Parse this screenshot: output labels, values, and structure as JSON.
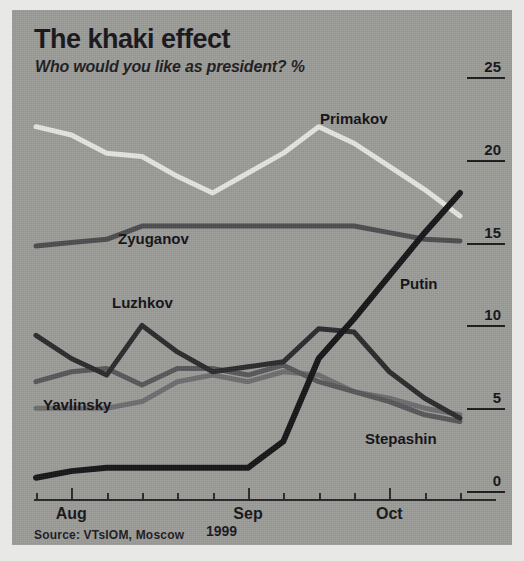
{
  "header": {
    "title": "The khaki effect",
    "subtitle": "Who would you like as president? %"
  },
  "source": "Source: VTsIOM, Moscow",
  "year_label": "1999",
  "colors": {
    "background": "#9c9c99",
    "text": "#141417",
    "primakov": "#e6e6e2",
    "zyuganov": "#4d4d50",
    "putin": "#161619",
    "luzhkov": "#2b2b2e",
    "yavlinsky": "#6e6e70",
    "stepashin": "#58585b"
  },
  "chart_data": {
    "type": "line",
    "title": "The khaki effect",
    "subtitle": "Who would you like as president? %",
    "xlabel": "1999",
    "ylabel": "%",
    "ylim": [
      0,
      25
    ],
    "yticks": [
      0,
      5,
      10,
      15,
      20,
      25
    ],
    "grid": false,
    "legend": "inline-labels",
    "x": [
      "Jul 25",
      "Aug 1",
      "Aug 8",
      "Aug 15",
      "Aug 22",
      "Aug 29",
      "Sep 5",
      "Sep 12",
      "Sep 19",
      "Sep 26",
      "Oct 3",
      "Oct 10",
      "Oct 17"
    ],
    "xtick_labels": [
      "Aug",
      "Sep",
      "Oct"
    ],
    "series": [
      {
        "name": "Primakov",
        "values": [
          22.0,
          21.5,
          20.4,
          20.2,
          19.0,
          18.0,
          19.2,
          20.4,
          22.0,
          21.0,
          19.6,
          18.2,
          16.6
        ]
      },
      {
        "name": "Zyuganov",
        "values": [
          14.8,
          15.0,
          15.2,
          16.0,
          16.0,
          16.0,
          16.0,
          16.0,
          16.0,
          16.0,
          15.6,
          15.2,
          15.1
        ]
      },
      {
        "name": "Luzhkov",
        "values": [
          9.4,
          8.0,
          7.0,
          10.0,
          8.4,
          7.2,
          7.5,
          7.8,
          9.8,
          9.6,
          7.2,
          5.6,
          4.4
        ]
      },
      {
        "name": "Yavlinsky",
        "values": [
          5.0,
          5.0,
          5.0,
          5.4,
          6.6,
          7.0,
          6.6,
          7.2,
          7.0,
          6.0,
          5.6,
          5.0,
          4.6
        ]
      },
      {
        "name": "Stepashin",
        "values": [
          6.6,
          7.2,
          7.4,
          6.4,
          7.4,
          7.4,
          7.0,
          7.6,
          6.6,
          6.0,
          5.4,
          4.6,
          4.2
        ]
      },
      {
        "name": "Putin",
        "values": [
          0.8,
          1.2,
          1.4,
          1.4,
          1.4,
          1.4,
          1.4,
          3.0,
          8.0,
          10.4,
          13.0,
          15.6,
          18.0
        ]
      }
    ],
    "annotations": [
      {
        "text": "Primakov",
        "series": "Primakov",
        "x": 320,
        "y": 110
      },
      {
        "text": "Zyuganov",
        "series": "Zyuganov",
        "x": 118,
        "y": 230
      },
      {
        "text": "Luzhkov",
        "series": "Luzhkov",
        "x": 112,
        "y": 294
      },
      {
        "text": "Yavlinsky",
        "series": "Yavlinsky",
        "x": 43,
        "y": 396
      },
      {
        "text": "Putin",
        "series": "Putin",
        "x": 400,
        "y": 275
      },
      {
        "text": "Stepashin",
        "series": "Stepashin",
        "x": 365,
        "y": 430
      }
    ]
  }
}
